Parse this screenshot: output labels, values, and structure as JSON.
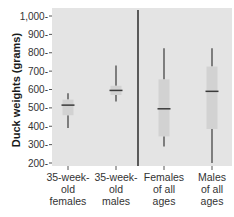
{
  "chart_data": {
    "type": "box",
    "title": "",
    "xlabel": "",
    "ylabel": "Duck weights (grams)",
    "ylim": [
      200,
      1000
    ],
    "yticks": [
      200,
      300,
      400,
      500,
      600,
      700,
      800,
      900,
      1000
    ],
    "ytick_labels": [
      "200",
      "300",
      "400",
      "500",
      "600",
      "700",
      "800",
      "900",
      "1,000"
    ],
    "grid": false,
    "legend": null,
    "divider_after_category": 1,
    "categories": [
      "35-week-old females",
      "35-week-old males",
      "Females of all ages",
      "Males of all ages"
    ],
    "category_labels": [
      [
        "35-week-",
        "old",
        "females"
      ],
      [
        "35-week-",
        "old",
        "males"
      ],
      [
        "Females",
        "of all",
        "ages"
      ],
      [
        "Males",
        "of all",
        "ages"
      ]
    ],
    "series": [
      {
        "name": "35-week-old females",
        "min": 390,
        "q1": 460,
        "median": 515,
        "q3": 545,
        "max": 580
      },
      {
        "name": "35-week-old males",
        "min": 535,
        "q1": 570,
        "median": 595,
        "q3": 620,
        "max": 730
      },
      {
        "name": "Females of all ages",
        "min": 290,
        "q1": 345,
        "median": 495,
        "q3": 655,
        "max": 825
      },
      {
        "name": "Males of all ages",
        "min": 200,
        "q1": 385,
        "median": 590,
        "q3": 725,
        "max": 825
      }
    ]
  },
  "colors": {
    "plot_bg": "#e4e4e4",
    "box_fill": "#d2d2d2",
    "line": "#3a3a3a",
    "divider": "#1f1f1f"
  }
}
